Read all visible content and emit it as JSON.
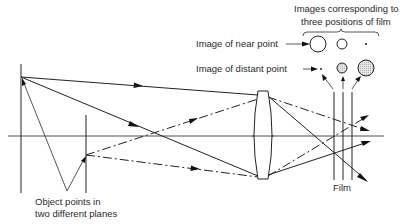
{
  "diagram": {
    "labels": {
      "images_header_line1": "Images corresponding to",
      "images_header_line2": "three positions of film",
      "near_point": "Image of near point",
      "distant_point": "Image of distant point",
      "film": "Film",
      "object_line1": "Object points in",
      "object_line2": "two different planes"
    },
    "elements": {
      "optical_axis": {
        "y": 136,
        "x_start": 8,
        "x_end": 384
      },
      "object_planes": [
        {
          "name": "near-object-plane",
          "x": 21,
          "y_top": 64,
          "y_bottom": 193,
          "point_y": 77
        },
        {
          "name": "distant-object-plane",
          "x": 86,
          "y_top": 115,
          "y_bottom": 193,
          "point_y": 155
        }
      ],
      "lens": {
        "type": "biconvex",
        "x_center": 263,
        "y_top": 91,
        "y_bottom": 179
      },
      "film_positions": [
        334,
        343,
        352
      ],
      "image_circles": {
        "near_point": [
          {
            "cx": 318,
            "cy": 44,
            "r": 8,
            "filled": false
          },
          {
            "cx": 342,
            "cy": 44,
            "r": 5,
            "filled": false
          },
          {
            "cx": 366,
            "cy": 44,
            "r": 1,
            "filled": true
          }
        ],
        "distant_point": [
          {
            "cx": 321,
            "cy": 69,
            "r": 1,
            "filled": true
          },
          {
            "cx": 342,
            "cy": 68,
            "r": 5,
            "filled": "shaded"
          },
          {
            "cx": 366,
            "cy": 68,
            "r": 8,
            "filled": "shaded"
          }
        ]
      }
    }
  }
}
